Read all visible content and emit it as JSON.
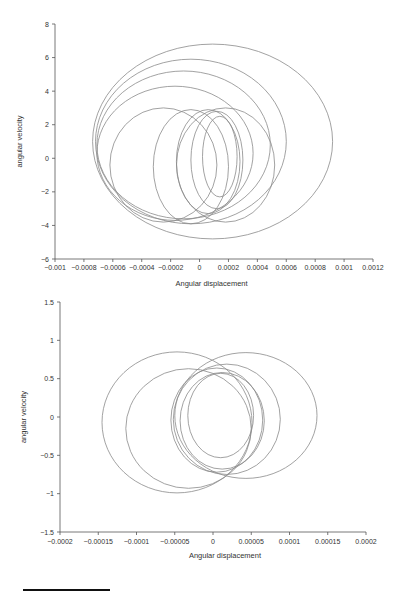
{
  "chart_data": [
    {
      "type": "line",
      "subtype": "phase-portrait",
      "title": "",
      "xlabel": "Angular displacement",
      "ylabel": "angular velocity",
      "xlim": [
        -0.001,
        0.0012
      ],
      "ylim": [
        -6,
        8
      ],
      "xticks": [
        "-0.001",
        "-0.0008",
        "-0.0006",
        "-0.0004",
        "-0.0002",
        "0",
        "0.0002",
        "0.0004",
        "0.0006",
        "0.0008",
        "0.001",
        "0.0012"
      ],
      "xtick_values": [
        -0.001,
        -0.0008,
        -0.0006,
        -0.0004,
        -0.0002,
        0,
        0.0002,
        0.0004,
        0.0006,
        0.0008,
        0.001,
        0.0012
      ],
      "yticks": [
        "-6",
        "-4",
        "-2",
        "0",
        "2",
        "4",
        "6",
        "8"
      ],
      "ytick_values": [
        -6,
        -4,
        -2,
        0,
        2,
        4,
        6,
        8
      ],
      "grid": false,
      "legend": null,
      "series": [
        {
          "name": "loop1",
          "cx": 9e-05,
          "cy": 1.0,
          "rx": 0.00083,
          "ry": 5.8
        },
        {
          "name": "loop2",
          "cx": -6e-05,
          "cy": 1.0,
          "rx": 0.00066,
          "ry": 4.9
        },
        {
          "name": "loop3",
          "cx": -0.00011,
          "cy": 0.8,
          "rx": 0.0006,
          "ry": 4.4
        },
        {
          "name": "loop4",
          "cx": -0.00017,
          "cy": 0.3,
          "rx": 0.00054,
          "ry": 4.0
        },
        {
          "name": "loop5",
          "cx": -0.00025,
          "cy": -0.4,
          "rx": 0.00037,
          "ry": 3.4
        },
        {
          "name": "loop6",
          "cx": -6e-05,
          "cy": -0.5,
          "rx": 0.00026,
          "ry": 3.4
        },
        {
          "name": "loop7",
          "cx": 0.00018,
          "cy": -0.4,
          "rx": 0.00034,
          "ry": 3.4
        },
        {
          "name": "loop8",
          "cx": 6e-05,
          "cy": -0.2,
          "rx": 0.00022,
          "ry": 3.1
        },
        {
          "name": "loop9",
          "cx": 0.00012,
          "cy": -0.1,
          "rx": 0.00018,
          "ry": 2.9
        },
        {
          "name": "loop10",
          "cx": 0.00014,
          "cy": 0.1,
          "rx": 0.00012,
          "ry": 2.4
        }
      ]
    },
    {
      "type": "line",
      "subtype": "phase-portrait",
      "title": "",
      "xlabel": "Angular displacement",
      "ylabel": "angular velocity",
      "xlim": [
        -0.0002,
        0.0002
      ],
      "ylim": [
        -1.5,
        1.5
      ],
      "xticks": [
        "-0.0002",
        "-0.00015",
        "-0.0001",
        "-0.00005",
        "0",
        "0.00005",
        "0.0001",
        "0.00015",
        "0.0002"
      ],
      "xtick_values": [
        -0.0002,
        -0.00015,
        -0.0001,
        -5e-05,
        0,
        5e-05,
        0.0001,
        0.00015,
        0.0002
      ],
      "yticks": [
        "-1.5",
        "-1",
        "-0.5",
        "0",
        "0.5",
        "1",
        "1.5"
      ],
      "ytick_values": [
        -1.5,
        -1,
        -0.5,
        0,
        0.5,
        1,
        1.5
      ],
      "grid": false,
      "legend": null,
      "series": [
        {
          "name": "loop1",
          "cx": -4.7e-05,
          "cy": -0.07,
          "rx": 9.8e-05,
          "ry": 0.92
        },
        {
          "name": "loop2",
          "cx": -3.2e-05,
          "cy": -0.15,
          "rx": 8.2e-05,
          "ry": 0.78
        },
        {
          "name": "loop3",
          "cx": 4.3e-05,
          "cy": 0.02,
          "rx": 9.3e-05,
          "ry": 0.82
        },
        {
          "name": "loop4",
          "cx": 1.8e-05,
          "cy": -0.03,
          "rx": 7e-05,
          "ry": 0.72
        },
        {
          "name": "loop5",
          "cx": 5e-06,
          "cy": -0.04,
          "rx": 6e-05,
          "ry": 0.68
        },
        {
          "name": "loop6",
          "cx": 1.2e-05,
          "cy": -0.05,
          "rx": 5.5e-05,
          "ry": 0.63
        },
        {
          "name": "loop7",
          "cx": 1e-05,
          "cy": 0.02,
          "rx": 4.3e-05,
          "ry": 0.55
        }
      ]
    }
  ],
  "footnote_rule": true
}
